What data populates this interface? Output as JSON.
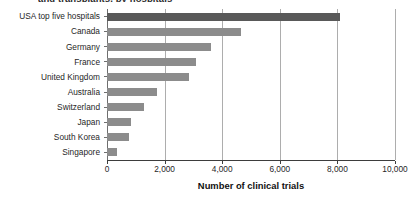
{
  "chart_data": {
    "type": "bar",
    "orientation": "horizontal",
    "title": "",
    "xlabel": "Number of clinical trials",
    "ylabel": "",
    "xlim": [
      0,
      10000
    ],
    "grid": "vertical",
    "legend": "none",
    "categories": [
      "USA top five hospitals",
      "Canada",
      "Germany",
      "France",
      "United Kingdom",
      "Australia",
      "Switzerland",
      "Japan",
      "South Korea",
      "Singapore"
    ],
    "values": [
      8100,
      4640,
      3620,
      3080,
      2840,
      1740,
      1300,
      830,
      760,
      330
    ],
    "xticks": [
      0,
      2000,
      4000,
      6000,
      8000,
      10000
    ],
    "xtick_labels": [
      "0",
      "2,000",
      "4,000",
      "6,000",
      "8,000",
      "10,000"
    ],
    "colors": {
      "bar": "#8c8c8c",
      "highlight_bar": "#595959",
      "gridline": "#adadad",
      "axis": "#3d3d3d",
      "text": "#1f1f1f",
      "background": "#ffffff"
    },
    "highlight_index": 0
  },
  "figure": {
    "title_cropped": "and transplants, by hospitals"
  }
}
